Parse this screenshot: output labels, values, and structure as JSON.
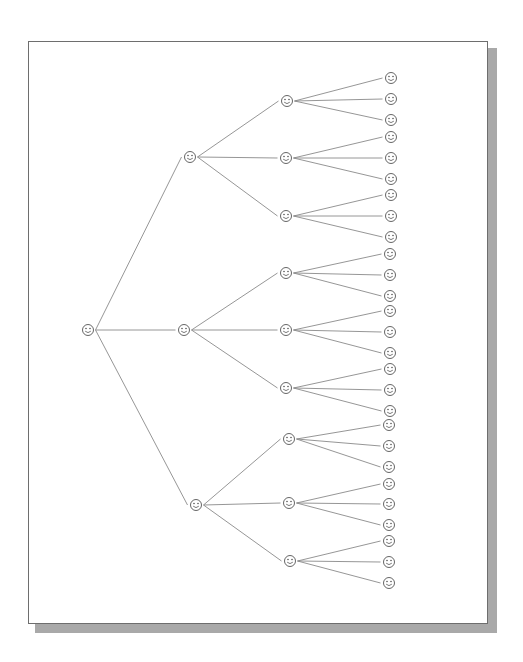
{
  "diagram": {
    "type": "tree",
    "orientation": "left-to-right",
    "branching_factor": 3,
    "depth": 3,
    "node_icon": "smiley-face-icon",
    "colors": {
      "line": "#8a8a8a",
      "node_stroke": "#555555",
      "shadow": "#a9a9a9",
      "frame": "#6e6e6e"
    },
    "root": {
      "x": 88,
      "y": 330
    },
    "level1": [
      {
        "x": 190,
        "y": 157
      },
      {
        "x": 184,
        "y": 330
      },
      {
        "x": 196,
        "y": 505
      }
    ],
    "level2": [
      {
        "x": 287,
        "y": 101,
        "parent": 0
      },
      {
        "x": 286,
        "y": 158,
        "parent": 0
      },
      {
        "x": 286,
        "y": 216,
        "parent": 0
      },
      {
        "x": 286,
        "y": 273,
        "parent": 1
      },
      {
        "x": 286,
        "y": 330,
        "parent": 1
      },
      {
        "x": 286,
        "y": 388,
        "parent": 1
      },
      {
        "x": 289,
        "y": 439,
        "parent": 2
      },
      {
        "x": 289,
        "y": 503,
        "parent": 2
      },
      {
        "x": 290,
        "y": 561,
        "parent": 2
      }
    ],
    "leaves": [
      {
        "x": 391,
        "y": 78,
        "parent": 0
      },
      {
        "x": 391,
        "y": 99,
        "parent": 0
      },
      {
        "x": 391,
        "y": 120,
        "parent": 0
      },
      {
        "x": 391,
        "y": 137,
        "parent": 1
      },
      {
        "x": 391,
        "y": 158,
        "parent": 1
      },
      {
        "x": 391,
        "y": 179,
        "parent": 1
      },
      {
        "x": 391,
        "y": 195,
        "parent": 2
      },
      {
        "x": 391,
        "y": 216,
        "parent": 2
      },
      {
        "x": 391,
        "y": 237,
        "parent": 2
      },
      {
        "x": 390,
        "y": 254,
        "parent": 3
      },
      {
        "x": 390,
        "y": 275,
        "parent": 3
      },
      {
        "x": 390,
        "y": 296,
        "parent": 3
      },
      {
        "x": 390,
        "y": 311,
        "parent": 4
      },
      {
        "x": 390,
        "y": 332,
        "parent": 4
      },
      {
        "x": 390,
        "y": 353,
        "parent": 4
      },
      {
        "x": 390,
        "y": 369,
        "parent": 5
      },
      {
        "x": 390,
        "y": 390,
        "parent": 5
      },
      {
        "x": 390,
        "y": 411,
        "parent": 5
      },
      {
        "x": 389,
        "y": 425,
        "parent": 6
      },
      {
        "x": 389,
        "y": 446,
        "parent": 6
      },
      {
        "x": 389,
        "y": 467,
        "parent": 6
      },
      {
        "x": 389,
        "y": 484,
        "parent": 7
      },
      {
        "x": 389,
        "y": 504,
        "parent": 7
      },
      {
        "x": 389,
        "y": 525,
        "parent": 7
      },
      {
        "x": 389,
        "y": 541,
        "parent": 8
      },
      {
        "x": 389,
        "y": 562,
        "parent": 8
      },
      {
        "x": 389,
        "y": 583,
        "parent": 8
      }
    ]
  }
}
